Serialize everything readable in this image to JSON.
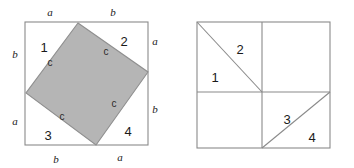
{
  "figure": {
    "colors": {
      "stroke": "#8a8a8a",
      "stroke_dark": "#707070",
      "shaded_fill": "#b5b5b5",
      "shaded_stroke": "#8f8f8f",
      "label_color": "#1a1a1a",
      "background": "#ffffff"
    },
    "left_diagram": {
      "name": "tilted-square-in-square",
      "outer_square": {
        "x": 25,
        "y": 22,
        "size": 123
      },
      "inner_square_vertices": [
        {
          "x": 78,
          "y": 23
        },
        {
          "x": 148,
          "y": 72
        },
        {
          "x": 96,
          "y": 145
        },
        {
          "x": 26,
          "y": 93
        }
      ],
      "region_labels": [
        {
          "text": "1",
          "x": 44,
          "y": 52
        },
        {
          "text": "2",
          "x": 124,
          "y": 46
        },
        {
          "text": "3",
          "x": 48,
          "y": 140
        },
        {
          "text": "4",
          "x": 128,
          "y": 136
        }
      ],
      "hypotenuse_labels": [
        {
          "text": "c",
          "x": 50,
          "y": 66
        },
        {
          "text": "c",
          "x": 106,
          "y": 55
        },
        {
          "text": "c",
          "x": 62,
          "y": 120
        },
        {
          "text": "c",
          "x": 114,
          "y": 107
        }
      ],
      "edge_labels": [
        {
          "text": "a",
          "x": 50,
          "y": 16,
          "edge": "top-left"
        },
        {
          "text": "b",
          "x": 113,
          "y": 16,
          "edge": "top-right"
        },
        {
          "text": "b",
          "x": 15,
          "y": 58,
          "edge": "left-upper"
        },
        {
          "text": "a",
          "x": 15,
          "y": 125,
          "edge": "left-lower"
        },
        {
          "text": "a",
          "x": 155,
          "y": 45,
          "edge": "right-upper"
        },
        {
          "text": "b",
          "x": 155,
          "y": 113,
          "edge": "right-lower"
        },
        {
          "text": "b",
          "x": 56,
          "y": 163,
          "edge": "bottom-left"
        },
        {
          "text": "a",
          "x": 120,
          "y": 161,
          "edge": "bottom-right"
        }
      ]
    },
    "right_diagram": {
      "name": "rearranged-squares",
      "outer_square": {
        "x": 197,
        "y": 22,
        "size": 133
      },
      "divider_vertical_x": 262,
      "divider_horizontal_y": 92,
      "diagonals": [
        {
          "from": {
            "x": 197,
            "y": 22
          },
          "to": {
            "x": 262,
            "y": 92
          },
          "name": "upper-left-diagonal"
        },
        {
          "from": {
            "x": 262,
            "y": 148
          },
          "to": {
            "x": 330,
            "y": 92
          },
          "name": "lower-right-diagonal"
        }
      ],
      "region_labels": [
        {
          "text": "2",
          "x": 240,
          "y": 50
        },
        {
          "text": "1",
          "x": 216,
          "y": 78
        },
        {
          "text": "3",
          "x": 288,
          "y": 120
        },
        {
          "text": "4",
          "x": 312,
          "y": 140
        }
      ]
    }
  }
}
